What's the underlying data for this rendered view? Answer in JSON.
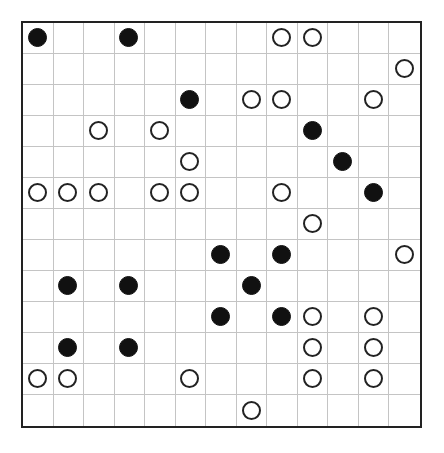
{
  "puzzle": {
    "type": "masyu",
    "rows": 13,
    "cols": 13,
    "colors": {
      "border": "#222222",
      "gridline": "#c4c4c4",
      "black_pearl": "#111111",
      "white_pearl_outline": "#222222",
      "background": "#ffffff"
    },
    "pearls": [
      {
        "row": 0,
        "col": 0,
        "color": "black"
      },
      {
        "row": 0,
        "col": 3,
        "color": "black"
      },
      {
        "row": 0,
        "col": 8,
        "color": "white"
      },
      {
        "row": 0,
        "col": 9,
        "color": "white"
      },
      {
        "row": 1,
        "col": 12,
        "color": "white"
      },
      {
        "row": 2,
        "col": 5,
        "color": "black"
      },
      {
        "row": 2,
        "col": 7,
        "color": "white"
      },
      {
        "row": 2,
        "col": 8,
        "color": "white"
      },
      {
        "row": 2,
        "col": 11,
        "color": "white"
      },
      {
        "row": 3,
        "col": 2,
        "color": "white"
      },
      {
        "row": 3,
        "col": 4,
        "color": "white"
      },
      {
        "row": 3,
        "col": 9,
        "color": "black"
      },
      {
        "row": 4,
        "col": 5,
        "color": "white"
      },
      {
        "row": 4,
        "col": 10,
        "color": "black"
      },
      {
        "row": 5,
        "col": 0,
        "color": "white"
      },
      {
        "row": 5,
        "col": 1,
        "color": "white"
      },
      {
        "row": 5,
        "col": 2,
        "color": "white"
      },
      {
        "row": 5,
        "col": 4,
        "color": "white"
      },
      {
        "row": 5,
        "col": 5,
        "color": "white"
      },
      {
        "row": 5,
        "col": 8,
        "color": "white"
      },
      {
        "row": 5,
        "col": 11,
        "color": "black"
      },
      {
        "row": 6,
        "col": 9,
        "color": "white"
      },
      {
        "row": 7,
        "col": 6,
        "color": "black"
      },
      {
        "row": 7,
        "col": 8,
        "color": "black"
      },
      {
        "row": 7,
        "col": 12,
        "color": "white"
      },
      {
        "row": 8,
        "col": 1,
        "color": "black"
      },
      {
        "row": 8,
        "col": 3,
        "color": "black"
      },
      {
        "row": 8,
        "col": 7,
        "color": "black"
      },
      {
        "row": 9,
        "col": 6,
        "color": "black"
      },
      {
        "row": 9,
        "col": 8,
        "color": "black"
      },
      {
        "row": 9,
        "col": 9,
        "color": "white"
      },
      {
        "row": 9,
        "col": 11,
        "color": "white"
      },
      {
        "row": 10,
        "col": 1,
        "color": "black"
      },
      {
        "row": 10,
        "col": 3,
        "color": "black"
      },
      {
        "row": 10,
        "col": 9,
        "color": "white"
      },
      {
        "row": 10,
        "col": 11,
        "color": "white"
      },
      {
        "row": 11,
        "col": 0,
        "color": "white"
      },
      {
        "row": 11,
        "col": 1,
        "color": "white"
      },
      {
        "row": 11,
        "col": 5,
        "color": "white"
      },
      {
        "row": 11,
        "col": 9,
        "color": "white"
      },
      {
        "row": 11,
        "col": 11,
        "color": "white"
      },
      {
        "row": 12,
        "col": 7,
        "color": "white"
      }
    ]
  }
}
